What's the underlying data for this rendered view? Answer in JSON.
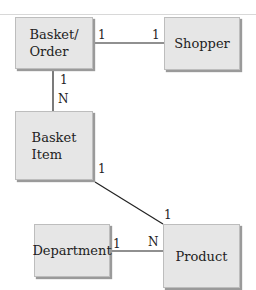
{
  "diagram": {
    "type": "entity-relationship",
    "entities": [
      {
        "id": "basket_order",
        "label": "Basket/\nOrder",
        "lines": [
          "Basket/",
          "Order"
        ]
      },
      {
        "id": "shopper",
        "label": "Shopper",
        "lines": [
          "Shopper"
        ]
      },
      {
        "id": "basket_item",
        "label": "Basket\nItem",
        "lines": [
          "Basket",
          "Item"
        ]
      },
      {
        "id": "department",
        "label": "Department",
        "lines": [
          "Department"
        ]
      },
      {
        "id": "product",
        "label": "Product",
        "lines": [
          "Product"
        ]
      }
    ],
    "relationships": [
      {
        "from": "basket_order",
        "to": "shopper",
        "from_card": "1",
        "to_card": "1"
      },
      {
        "from": "basket_order",
        "to": "basket_item",
        "from_card": "1",
        "to_card": "N"
      },
      {
        "from": "basket_item",
        "to": "product",
        "from_card": "1",
        "to_card": "1"
      },
      {
        "from": "department",
        "to": "product",
        "from_card": "1",
        "to_card": "N"
      }
    ]
  },
  "colors": {
    "entity_fill": "#e6e6e6",
    "entity_border": "#bdbdbd",
    "line": "#222222"
  }
}
